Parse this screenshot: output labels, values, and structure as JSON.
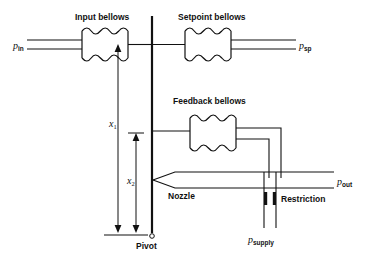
{
  "diagram": {
    "labels": {
      "input_bellows": "Input bellows",
      "setpoint_bellows": "Setpoint bellows",
      "feedback_bellows": "Feedback bellows",
      "nozzle": "Nozzle",
      "restriction": "Restriction",
      "pivot": "Pivot"
    },
    "pressures": {
      "p_in": {
        "symbol": "p",
        "subscript": "in"
      },
      "p_sp": {
        "symbol": "p",
        "subscript": "sp"
      },
      "p_out": {
        "symbol": "p",
        "subscript": "out"
      },
      "p_supply": {
        "symbol": "p",
        "subscript": "supply"
      }
    },
    "dimensions": {
      "x1": {
        "symbol": "x",
        "subscript": "1"
      },
      "x2": {
        "symbol": "x",
        "subscript": "2"
      }
    },
    "colors": {
      "line": "#111111",
      "background": "#ffffff"
    }
  }
}
